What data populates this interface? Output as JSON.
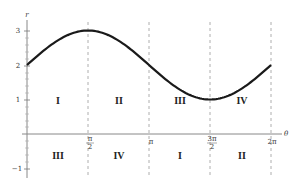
{
  "chart_data": {
    "type": "line",
    "title": "",
    "function": "r = 2 + sin(theta)",
    "xlabel": "θ",
    "ylabel": "r",
    "xlim": [
      0,
      6.2832
    ],
    "ylim": [
      -1,
      3
    ],
    "x_ticks": [
      {
        "value": 1.5708,
        "label": "π/2"
      },
      {
        "value": 3.1416,
        "label": "π"
      },
      {
        "value": 4.7124,
        "label": "3π/2"
      },
      {
        "value": 6.2832,
        "label": "2π"
      }
    ],
    "y_ticks": [
      {
        "value": 3,
        "label": "3"
      },
      {
        "value": 2,
        "label": "2"
      },
      {
        "value": 1,
        "label": "1"
      },
      {
        "value": -1,
        "label": "−1"
      }
    ],
    "grid": false,
    "vertical_dashed_lines_at": [
      1.5708,
      3.1416,
      4.7124,
      6.2832
    ],
    "series": [
      {
        "name": "r = 2 + sin θ",
        "x": [
          0,
          0.7854,
          1.5708,
          2.3562,
          3.1416,
          3.927,
          4.7124,
          5.4978,
          6.2832
        ],
        "values": [
          2,
          2.707,
          3,
          2.707,
          2,
          1.293,
          1,
          1.293,
          2
        ]
      }
    ],
    "annotations": {
      "upper_row": [
        "I",
        "II",
        "III",
        "IV"
      ],
      "lower_row": [
        "III",
        "IV",
        "I",
        "II"
      ]
    },
    "colors": {
      "curve": "#1a1a1a",
      "axis": "#888888",
      "dashed": "#999999",
      "text": "#333333"
    }
  }
}
